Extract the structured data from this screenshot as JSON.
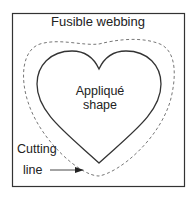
{
  "diagram": {
    "title": "Fusible webbing",
    "center_label_line1": "Appliqué",
    "center_label_line2": "shape",
    "cut_label_line1": "Cutting",
    "cut_label_line2": "line",
    "colors": {
      "stroke": "#333333",
      "dashed": "#777777",
      "background": "#ffffff",
      "text": "#222222"
    }
  }
}
